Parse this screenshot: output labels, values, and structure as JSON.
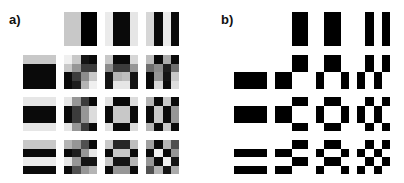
{
  "panels": [
    {
      "id": "a",
      "label": "a)",
      "label_pos": [
        9,
        13
      ],
      "style": "grayscale",
      "col_x": [
        23,
        64,
        105,
        146
      ],
      "row_y": [
        12,
        55,
        97,
        140
      ],
      "cells": [
        [
          null,
          [
            [
              200,
              200,
              0,
              0
            ],
            [
              200,
              200,
              0,
              0
            ],
            [
              200,
              200,
              0,
              0
            ],
            [
              200,
              200,
              0,
              0
            ]
          ],
          [
            [
              235,
              10,
              10,
              230
            ],
            [
              235,
              10,
              10,
              230
            ],
            [
              235,
              10,
              10,
              230
            ],
            [
              235,
              10,
              10,
              230
            ]
          ],
          [
            [
              215,
              10,
              235,
              10
            ],
            [
              215,
              10,
              235,
              10
            ],
            [
              215,
              10,
              235,
              10
            ],
            [
              215,
              10,
              235,
              10
            ]
          ]
        ],
        [
          [
            [
              200,
              200,
              200,
              200
            ],
            [
              10,
              10,
              10,
              10
            ],
            [
              10,
              10,
              10,
              10
            ],
            [
              10,
              10,
              10,
              10
            ]
          ],
          [
            [
              240,
              200,
              20,
              10
            ],
            [
              200,
              150,
              60,
              60
            ],
            [
              10,
              60,
              140,
              200
            ],
            [
              10,
              30,
              180,
              240
            ]
          ],
          [
            [
              200,
              10,
              10,
              215
            ],
            [
              140,
              60,
              60,
              150
            ],
            [
              20,
              180,
              190,
              20
            ],
            [
              20,
              230,
              230,
              20
            ]
          ],
          [
            [
              190,
              10,
              170,
              10
            ],
            [
              110,
              140,
              30,
              110
            ],
            [
              10,
              150,
              20,
              200
            ],
            [
              10,
              215,
              10,
              220
            ]
          ]
        ],
        [
          [
            [
              230,
              230,
              230,
              230
            ],
            [
              10,
              10,
              10,
              10
            ],
            [
              10,
              10,
              10,
              10
            ],
            [
              230,
              230,
              230,
              230
            ]
          ],
          [
            [
              230,
              150,
              60,
              10
            ],
            [
              10,
              60,
              150,
              220
            ],
            [
              10,
              60,
              150,
              220
            ],
            [
              230,
              150,
              60,
              10
            ]
          ],
          [
            [
              225,
              10,
              10,
              220
            ],
            [
              10,
              200,
              200,
              10
            ],
            [
              10,
              200,
              200,
              10
            ],
            [
              225,
              10,
              10,
              220
            ]
          ],
          [
            [
              180,
              10,
              200,
              10
            ],
            [
              10,
              200,
              10,
              150
            ],
            [
              10,
              200,
              10,
              150
            ],
            [
              180,
              10,
              200,
              10
            ]
          ]
        ],
        [
          [
            [
              200,
              200,
              200,
              200
            ],
            [
              10,
              10,
              10,
              10
            ],
            [
              235,
              235,
              235,
              235
            ],
            [
              10,
              10,
              10,
              10
            ]
          ],
          [
            [
              180,
              150,
              80,
              10
            ],
            [
              10,
              30,
              150,
              230
            ],
            [
              230,
              150,
              20,
              20
            ],
            [
              10,
              80,
              150,
              180
            ]
          ],
          [
            [
              200,
              40,
              40,
              190
            ],
            [
              10,
              200,
              200,
              10
            ],
            [
              200,
              20,
              20,
              180
            ],
            [
              10,
              150,
              150,
              10
            ]
          ],
          [
            [
              160,
              10,
              180,
              80
            ],
            [
              10,
              240,
              10,
              150
            ],
            [
              150,
              10,
              240,
              20
            ],
            [
              80,
              180,
              20,
              170
            ]
          ]
        ]
      ]
    },
    {
      "id": "b",
      "label": "b)",
      "label_pos": [
        221,
        13
      ],
      "style": "binary",
      "col_x": [
        234,
        275,
        316,
        357
      ],
      "row_y": [
        12,
        55,
        97,
        140
      ],
      "cells": [
        [
          null,
          [
            [
              255,
              255,
              0,
              0
            ],
            [
              255,
              255,
              0,
              0
            ],
            [
              255,
              255,
              0,
              0
            ],
            [
              255,
              255,
              0,
              0
            ]
          ],
          [
            [
              255,
              0,
              0,
              255
            ],
            [
              255,
              0,
              0,
              255
            ],
            [
              255,
              0,
              0,
              255
            ],
            [
              255,
              0,
              0,
              255
            ]
          ],
          [
            [
              255,
              0,
              255,
              0
            ],
            [
              255,
              0,
              255,
              0
            ],
            [
              255,
              0,
              255,
              0
            ],
            [
              255,
              0,
              255,
              0
            ]
          ]
        ],
        [
          [
            [
              255,
              255,
              255,
              255
            ],
            [
              255,
              255,
              255,
              255
            ],
            [
              0,
              0,
              0,
              0
            ],
            [
              0,
              0,
              0,
              0
            ]
          ],
          [
            [
              255,
              255,
              0,
              0
            ],
            [
              255,
              255,
              0,
              0
            ],
            [
              0,
              0,
              255,
              255
            ],
            [
              0,
              0,
              255,
              255
            ]
          ],
          [
            [
              255,
              0,
              0,
              255
            ],
            [
              255,
              0,
              0,
              255
            ],
            [
              0,
              255,
              255,
              0
            ],
            [
              0,
              255,
              255,
              0
            ]
          ],
          [
            [
              255,
              0,
              255,
              0
            ],
            [
              255,
              0,
              255,
              0
            ],
            [
              0,
              255,
              0,
              255
            ],
            [
              0,
              255,
              0,
              255
            ]
          ]
        ],
        [
          [
            [
              255,
              255,
              255,
              255
            ],
            [
              0,
              0,
              0,
              0
            ],
            [
              0,
              0,
              0,
              0
            ],
            [
              255,
              255,
              255,
              255
            ]
          ],
          [
            [
              255,
              255,
              0,
              0
            ],
            [
              0,
              0,
              255,
              255
            ],
            [
              0,
              0,
              255,
              255
            ],
            [
              255,
              255,
              0,
              0
            ]
          ],
          [
            [
              255,
              0,
              0,
              255
            ],
            [
              0,
              255,
              255,
              0
            ],
            [
              0,
              255,
              255,
              0
            ],
            [
              255,
              0,
              0,
              255
            ]
          ],
          [
            [
              255,
              0,
              255,
              0
            ],
            [
              0,
              255,
              0,
              255
            ],
            [
              0,
              255,
              0,
              255
            ],
            [
              255,
              0,
              255,
              0
            ]
          ]
        ],
        [
          [
            [
              255,
              255,
              255,
              255
            ],
            [
              0,
              0,
              0,
              0
            ],
            [
              255,
              255,
              255,
              255
            ],
            [
              0,
              0,
              0,
              0
            ]
          ],
          [
            [
              255,
              255,
              0,
              0
            ],
            [
              0,
              0,
              255,
              255
            ],
            [
              255,
              255,
              0,
              0
            ],
            [
              0,
              0,
              255,
              255
            ]
          ],
          [
            [
              255,
              0,
              0,
              255
            ],
            [
              0,
              255,
              255,
              0
            ],
            [
              255,
              0,
              0,
              255
            ],
            [
              0,
              255,
              255,
              0
            ]
          ],
          [
            [
              255,
              0,
              255,
              0
            ],
            [
              0,
              255,
              0,
              255
            ],
            [
              255,
              0,
              255,
              0
            ],
            [
              0,
              255,
              0,
              255
            ]
          ]
        ]
      ]
    }
  ]
}
